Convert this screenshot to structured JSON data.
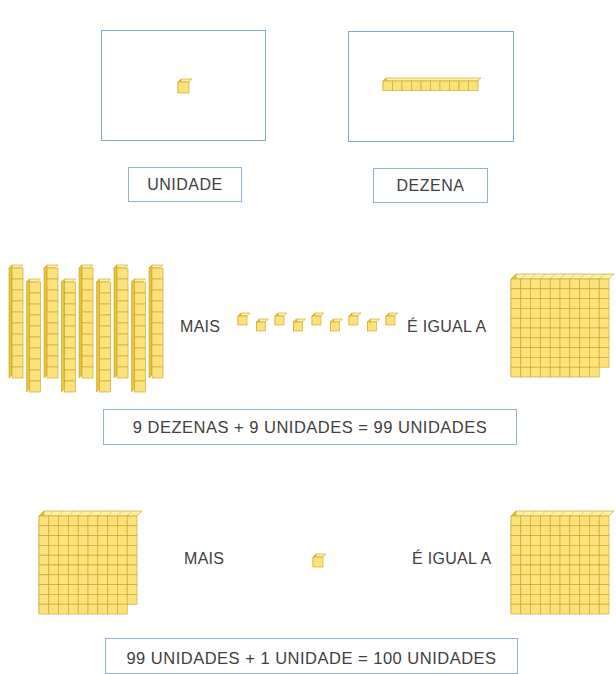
{
  "colors": {
    "frame_border": "#7fa6d6",
    "cube_face": "#fbe27a",
    "cube_top": "#fdf0a8",
    "cube_side": "#e9c43a",
    "cube_edge": "#c9a227",
    "text": "#404040"
  },
  "section1": {
    "unidade": {
      "label": "UNIDADE",
      "block": "unit"
    },
    "dezena": {
      "label": "DEZENA",
      "block": "rod",
      "cubes": 10
    }
  },
  "section2": {
    "left_block": {
      "type": "rods",
      "count": 9,
      "cubes_per_rod": 10
    },
    "word_plus": "MAIS",
    "units_count": 9,
    "word_equals": "É IGUAL A",
    "result_block": {
      "type": "flat",
      "cubes": 99
    },
    "equation": "9 DEZENAS + 9 UNIDADES = 99 UNIDADES"
  },
  "section3": {
    "left_block": {
      "type": "flat",
      "cubes": 99
    },
    "word_plus": "MAIS",
    "units_count": 1,
    "word_equals": "É IGUAL A",
    "result_block": {
      "type": "flat",
      "cubes": 100
    },
    "equation": "99 UNIDADES + 1 UNIDADE = 100 UNIDADES"
  }
}
